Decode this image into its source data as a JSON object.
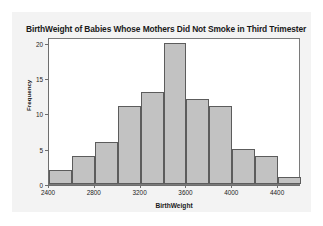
{
  "chart_data": {
    "type": "bar",
    "title": "BirthWeight of Babies Whose Mothers Did Not Smoke in Third Trimester",
    "xlabel": "BirthWeight",
    "ylabel": "Frequency",
    "bin_width": 200,
    "bin_starts": [
      2400,
      2600,
      2800,
      3000,
      3200,
      3400,
      3600,
      3800,
      4000,
      4200,
      4400
    ],
    "categories": [
      "2400-2600",
      "2600-2800",
      "2800-3000",
      "3000-3200",
      "3200-3400",
      "3400-3600",
      "3600-3800",
      "3800-4000",
      "4000-4200",
      "4200-4400",
      "4400-4600"
    ],
    "values": [
      2,
      4,
      6,
      11,
      13,
      20,
      12,
      11,
      5,
      4,
      1
    ],
    "xlim": [
      2400,
      4600
    ],
    "ylim": [
      0,
      20.8
    ],
    "xticks": [
      2400,
      2800,
      3200,
      3600,
      4000,
      4400
    ],
    "xtick_labels": [
      "2400",
      "2800",
      "3200",
      "3600",
      "4000",
      "4400"
    ],
    "yticks": [
      0,
      5,
      10,
      15,
      20
    ],
    "ytick_labels": [
      "0",
      "5",
      "10",
      "15",
      "20"
    ],
    "grid": false,
    "legend": "none",
    "colors": {
      "bar_fill": "#c2c2c2",
      "bar_edge": "#5c5c5c",
      "axis": "#6e6e6e",
      "panel_background": "#f3f3f3",
      "plot_background": "#ffffff",
      "text": "#1a1a1a"
    }
  }
}
